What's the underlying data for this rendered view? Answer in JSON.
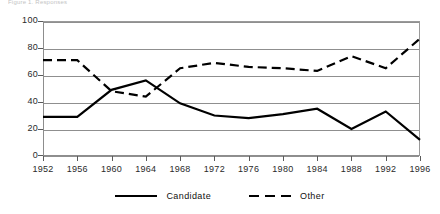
{
  "top_caption": "Figure 1. Responses",
  "chart_data": {
    "type": "line",
    "title": "",
    "subtitle": "",
    "xlabel": "",
    "ylabel": "",
    "categories": [
      "1952",
      "1956",
      "1960",
      "1964",
      "1968",
      "1972",
      "1976",
      "1980",
      "1984",
      "1988",
      "1992",
      "1996"
    ],
    "x": [
      1952,
      1956,
      1960,
      1964,
      1968,
      1972,
      1976,
      1980,
      1984,
      1988,
      1992,
      1996
    ],
    "xlim": [
      1952,
      1996
    ],
    "ylim": [
      0,
      100
    ],
    "yticks": [
      0,
      20,
      40,
      60,
      80,
      100
    ],
    "xticks": [
      1952,
      1956,
      1960,
      1964,
      1968,
      1972,
      1976,
      1980,
      1984,
      1988,
      1992,
      1996
    ],
    "grid": "horizontal",
    "legend_position": "bottom",
    "series": [
      {
        "name": "Candidate",
        "style": "solid",
        "color": "#000000",
        "values": [
          29,
          29,
          49,
          56,
          39,
          30,
          28,
          31,
          35,
          20,
          33,
          12
        ]
      },
      {
        "name": "Other",
        "style": "dashed",
        "color": "#000000",
        "values": [
          71,
          71,
          48,
          44,
          65,
          69,
          66,
          65,
          63,
          74,
          65,
          87
        ]
      }
    ]
  },
  "axis": {
    "y_tick_labels": [
      "0",
      "20",
      "40",
      "60",
      "80",
      "100"
    ],
    "x_tick_labels": [
      "1952",
      "1956",
      "1960",
      "1964",
      "1968",
      "1972",
      "1976",
      "1980",
      "1984",
      "1988",
      "1992",
      "1996"
    ]
  },
  "legend": {
    "items": [
      {
        "label": "Candidate",
        "style": "solid"
      },
      {
        "label": "Other",
        "style": "dashed"
      }
    ]
  }
}
